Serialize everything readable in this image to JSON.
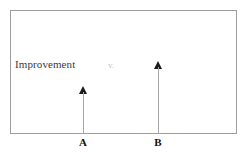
{
  "diagram": {
    "title_text": "Improvement",
    "comparison_text": "v.",
    "frame": {
      "border_color": "#9d9d9d",
      "background_color": "#ffffff"
    },
    "arrows": [
      {
        "id": "A",
        "label": "A",
        "height_value": 48,
        "head_color": "#1a1a1a",
        "shaft_color": "#a8a8a8",
        "direction": "up"
      },
      {
        "id": "B",
        "label": "B",
        "height_value": 73,
        "head_color": "#1a1a1a",
        "shaft_color": "#a8a8a8",
        "direction": "up"
      }
    ]
  },
  "chart_data": {
    "type": "bar",
    "categories": [
      "A",
      "B"
    ],
    "values": [
      48,
      73
    ],
    "title": "Improvement",
    "xlabel": "",
    "ylabel": "Improvement",
    "ylim": [
      0,
      124
    ],
    "grid": false,
    "legend": "none",
    "annotations": [
      "Improvement",
      "v."
    ]
  }
}
